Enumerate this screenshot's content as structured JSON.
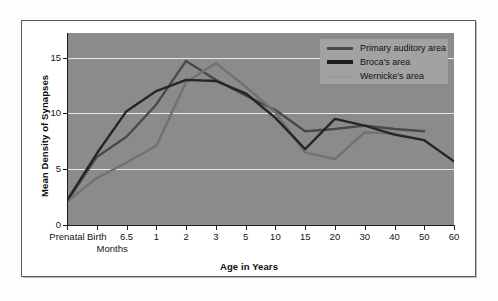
{
  "chart_data": {
    "type": "line",
    "title": "",
    "xlabel": "Age in Years",
    "ylabel": "Mean Density of Synapses",
    "sublabel": "Months",
    "categories": [
      "Prenatal",
      "Birth",
      "6.5",
      "1",
      "2",
      "3",
      "5",
      "10",
      "15",
      "20",
      "30",
      "40",
      "50",
      "60"
    ],
    "xtick_labels": [
      "Prenatal",
      "Birth",
      "6.5",
      "1",
      "2",
      "3",
      "5",
      "10",
      "15",
      "20",
      "30",
      "40",
      "50",
      "60"
    ],
    "ytick_labels": [
      "0",
      "5",
      "10",
      "15"
    ],
    "ytick_values": [
      0,
      5,
      10,
      15
    ],
    "ylim": [
      0,
      17.2
    ],
    "grid": true,
    "grid_axis": "y",
    "legend_position": "top-right",
    "plot_background": "#8b8b8b",
    "gridline_color": "#e8e8e8",
    "series": [
      {
        "name": "Primary auditory area",
        "color": "#4a4a4a",
        "points": [
          {
            "x": "Prenatal",
            "y": 2.1
          },
          {
            "x": "Birth",
            "y": 6.1
          },
          {
            "x": "6.5",
            "y": 7.9
          },
          {
            "x": "1",
            "y": 10.8
          },
          {
            "x": "2",
            "y": 14.7
          },
          {
            "x": "3",
            "y": 13.0
          },
          {
            "x": "5",
            "y": 11.6
          },
          {
            "x": "10",
            "y": 10.3
          },
          {
            "x": "15",
            "y": 8.4
          },
          {
            "x": "20",
            "y": 8.6
          },
          {
            "x": "30",
            "y": 8.9
          },
          {
            "x": "40",
            "y": 8.6
          },
          {
            "x": "50",
            "y": 8.4
          }
        ]
      },
      {
        "name": "Broca's area",
        "color": "#262626",
        "points": [
          {
            "x": "Prenatal",
            "y": 2.2
          },
          {
            "x": "Birth",
            "y": 6.4
          },
          {
            "x": "6.5",
            "y": 10.2
          },
          {
            "x": "1",
            "y": 12.0
          },
          {
            "x": "2",
            "y": 13.0
          },
          {
            "x": "3",
            "y": 12.9
          },
          {
            "x": "5",
            "y": 11.8
          },
          {
            "x": "10",
            "y": 9.6
          },
          {
            "x": "15",
            "y": 6.8
          },
          {
            "x": "20",
            "y": 9.5
          },
          {
            "x": "30",
            "y": 8.9
          },
          {
            "x": "40",
            "y": 8.1
          },
          {
            "x": "50",
            "y": 7.6
          },
          {
            "x": "60",
            "y": 5.7
          }
        ]
      },
      {
        "name": "Wernicke's area",
        "color": "#717171",
        "points": [
          {
            "x": "Prenatal",
            "y": 2.1
          },
          {
            "x": "Birth",
            "y": 4.2
          },
          {
            "x": "6.5",
            "y": 5.6
          },
          {
            "x": "1",
            "y": 7.1
          },
          {
            "x": "2",
            "y": 12.8
          },
          {
            "x": "3",
            "y": 14.5
          },
          {
            "x": "5",
            "y": 12.4
          },
          {
            "x": "10",
            "y": 10.1
          },
          {
            "x": "15",
            "y": 6.5
          },
          {
            "x": "20",
            "y": 5.9
          },
          {
            "x": "30",
            "y": 8.3
          },
          {
            "x": "40",
            "y": 8.2
          },
          {
            "x": "50",
            "y": 7.6
          }
        ]
      }
    ]
  },
  "legend": {
    "items": [
      {
        "label": "Primary auditory area",
        "color": "#4a4a4a"
      },
      {
        "label": "Broca's area",
        "color": "#1e1e1e"
      },
      {
        "label": "Wernicke's area",
        "color": "#9a9a9a"
      }
    ]
  }
}
